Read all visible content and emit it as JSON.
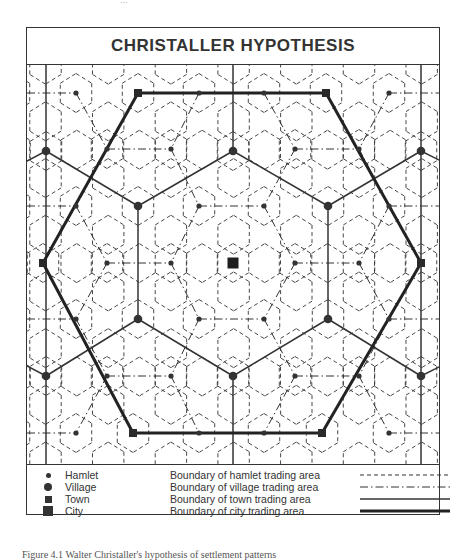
{
  "title": "CHRISTALLER HYPOTHESIS",
  "top_note": "...",
  "caption": "Figure 4.1   Walter Christaller's hypothesis of settlement patterns",
  "colors": {
    "ink": "#333333",
    "background": "#ffffff"
  },
  "legend": {
    "settlements": [
      {
        "symbol": "small-dot",
        "label": "Hamlet"
      },
      {
        "symbol": "large-dot",
        "label": "Village"
      },
      {
        "symbol": "small-square",
        "label": "Town"
      },
      {
        "symbol": "large-square",
        "label": "City"
      }
    ],
    "boundaries": [
      {
        "style": "dashed",
        "label": "Boundary of hamlet trading area"
      },
      {
        "style": "dash-dot",
        "label": "Boundary of village trading area"
      },
      {
        "style": "solid-thin",
        "label": "Boundary of town trading area"
      },
      {
        "style": "solid-thick",
        "label": "Boundary of city trading area"
      }
    ]
  },
  "diagram": {
    "origin": [
      26,
      63
    ],
    "city": [
      232,
      262
    ],
    "towns": [
      [
        137,
        92
      ],
      [
        325,
        92
      ],
      [
        42,
        262
      ],
      [
        420,
        262
      ],
      [
        132,
        432
      ],
      [
        321,
        432
      ]
    ],
    "villages": [
      [
        45,
        150
      ],
      [
        232,
        150
      ],
      [
        420,
        150
      ],
      [
        137,
        205
      ],
      [
        327,
        205
      ],
      [
        137,
        318
      ],
      [
        327,
        318
      ],
      [
        45,
        375
      ],
      [
        232,
        375
      ],
      [
        420,
        375
      ]
    ],
    "hamlets": [
      [
        75,
        92
      ],
      [
        198,
        92
      ],
      [
        263,
        92
      ],
      [
        388,
        92
      ],
      [
        106,
        148
      ],
      [
        170,
        148
      ],
      [
        294,
        148
      ],
      [
        358,
        148
      ],
      [
        75,
        205
      ],
      [
        198,
        205
      ],
      [
        263,
        205
      ],
      [
        388,
        205
      ],
      [
        106,
        262
      ],
      [
        170,
        262
      ],
      [
        294,
        262
      ],
      [
        358,
        262
      ],
      [
        75,
        318
      ],
      [
        198,
        318
      ],
      [
        263,
        318
      ],
      [
        388,
        318
      ],
      [
        106,
        375
      ],
      [
        170,
        375
      ],
      [
        294,
        375
      ],
      [
        358,
        375
      ],
      [
        75,
        432
      ],
      [
        198,
        432
      ],
      [
        263,
        432
      ],
      [
        388,
        432
      ]
    ]
  }
}
